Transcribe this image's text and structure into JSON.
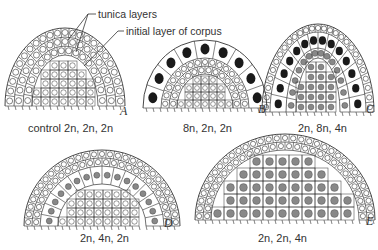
{
  "annotations": {
    "tunica_layers": "tunica layers",
    "initial_layer": "initial layer of corpus"
  },
  "panels": [
    {
      "letter": "A",
      "caption": "control 2n, 2n, 2n"
    },
    {
      "letter": "B",
      "caption": "8n, 2n, 2n"
    },
    {
      "letter": "C",
      "caption": "2n, 8n, 4n"
    },
    {
      "letter": "D",
      "caption": "2n, 4n, 2n"
    },
    {
      "letter": "E",
      "caption": "2n, 2n, 4n"
    }
  ],
  "colors": {
    "ink": "#333333",
    "nucleus_dark": "#1a1a1a",
    "nucleus_gray": "#888888",
    "background": "#ffffff"
  }
}
